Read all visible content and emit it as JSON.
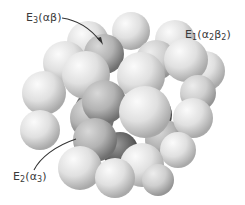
{
  "diagram": {
    "type": "space-filling subunit model",
    "labels": [
      {
        "id": "e3",
        "text": "E3(αβ)",
        "enzyme": "E",
        "subscript": "3",
        "composition": "(αβ)"
      },
      {
        "id": "e1",
        "text": "E1(α2β2)",
        "enzyme": "E",
        "subscript": "1",
        "composition_parts": [
          "(α",
          "2",
          "β",
          "2",
          ")"
        ]
      },
      {
        "id": "e2",
        "text": "E2(α3)",
        "enzyme": "E",
        "subscript": "2",
        "composition_parts": [
          "(α",
          "3",
          ")"
        ]
      }
    ],
    "colors": {
      "background": "#ffffff",
      "sphere_light": "#e6e6e6",
      "sphere_mid": "#c8c8c8",
      "sphere_dark": "#9a9a9a",
      "core_sphere_light": "#cfcfcf",
      "core_sphere_dark": "#7f7f7f",
      "leader_line": "#333333",
      "label_text": "#3a3a3a"
    }
  }
}
